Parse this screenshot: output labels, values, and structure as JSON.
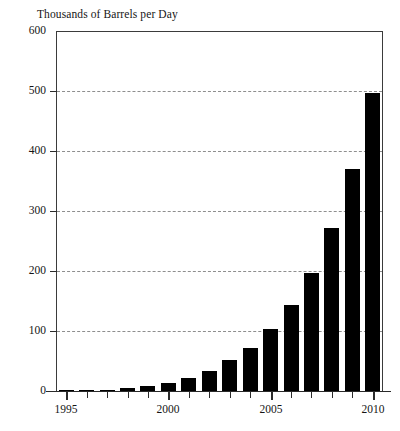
{
  "chart_data": {
    "type": "bar",
    "title": "Thousands of Barrels per Day",
    "subtitle": "",
    "xlabel": "",
    "ylabel": "",
    "categories": [
      1995,
      1996,
      1997,
      1998,
      1999,
      2000,
      2001,
      2002,
      2003,
      2004,
      2005,
      2006,
      2007,
      2008,
      2009,
      2010
    ],
    "values": [
      1,
      1,
      2,
      5,
      9,
      13,
      22,
      34,
      51,
      72,
      103,
      143,
      197,
      271,
      370,
      496
    ],
    "x_tick_labels": [
      "1995",
      "2000",
      "2005",
      "2010"
    ],
    "x_tick_values": [
      1995,
      2000,
      2005,
      2010
    ],
    "y_tick_labels": [
      "0",
      "100",
      "200",
      "300",
      "400",
      "500",
      "600"
    ],
    "y_tick_values": [
      0,
      100,
      200,
      300,
      400,
      500,
      600
    ],
    "ylim": [
      0,
      600
    ],
    "xlim": [
      1994.5,
      2010.5
    ],
    "grid": true,
    "grid_axis": "y",
    "grid_style": "dashed",
    "legend": false,
    "legend_position": "none",
    "bar_color": "#000000",
    "axis_color": "#2b2b2b",
    "grid_color": "#8e8e8e",
    "background_color": "#ffffff"
  }
}
